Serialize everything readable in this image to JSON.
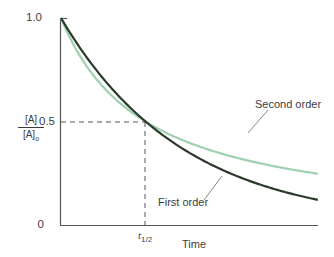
{
  "chart_data": {
    "type": "line",
    "title": "",
    "xlabel": "Time",
    "ylabel": "[A]/[A]0",
    "ylabel_numerator": "[A]",
    "ylabel_denominator": "[A]",
    "ylabel_denominator_sub": "0",
    "yticks": [
      "1.0",
      "0.5",
      "0"
    ],
    "ylim": [
      0,
      1.0
    ],
    "xticks": [
      {
        "label": "t",
        "sub": "1/2",
        "value": 1
      }
    ],
    "xlim": [
      0,
      3.04
    ],
    "grid": false,
    "reference_lines": [
      {
        "type": "horizontal-dashed",
        "y": 0.5,
        "from_x": 0,
        "to_x": 1
      },
      {
        "type": "vertical-dashed",
        "x": 1,
        "from_y": 0,
        "to_y": 0.5
      }
    ],
    "x": [
      0,
      0.25,
      0.5,
      0.75,
      1,
      1.25,
      1.5,
      1.75,
      2,
      2.25,
      2.5,
      2.75,
      3,
      3.04
    ],
    "series": [
      {
        "name": "First order",
        "color": "#2b3a2b",
        "values": [
          1.0,
          0.841,
          0.707,
          0.595,
          0.5,
          0.42,
          0.354,
          0.297,
          0.25,
          0.21,
          0.177,
          0.149,
          0.125,
          0.122
        ]
      },
      {
        "name": "Second order",
        "color": "#9fd0b0",
        "values": [
          1.0,
          0.8,
          0.667,
          0.571,
          0.5,
          0.444,
          0.4,
          0.364,
          0.333,
          0.308,
          0.286,
          0.267,
          0.25,
          0.248
        ]
      }
    ],
    "annotations": [
      {
        "text": "Second order",
        "points_to": "Second order"
      },
      {
        "text": "First order",
        "points_to": "First order"
      }
    ]
  },
  "labels": {
    "y_top": "1.0",
    "y_mid": "0.5",
    "y_zero": "0",
    "frac_num": "[A]",
    "frac_den": "[A]",
    "frac_sub": "o",
    "t_main": "t",
    "t_sub": "1/2",
    "x_axis": "Time",
    "second_order": "Second order",
    "first_order": "First order"
  }
}
